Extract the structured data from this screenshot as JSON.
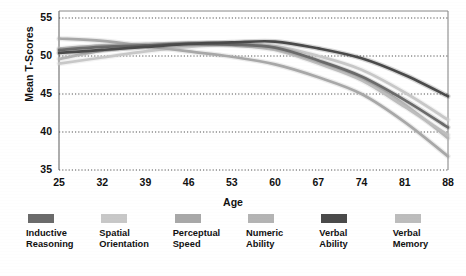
{
  "chart_data": {
    "type": "line",
    "title": "",
    "xlabel": "Age",
    "ylabel": "Mean T-Scores",
    "x": [
      25,
      32,
      39,
      46,
      53,
      60,
      67,
      74,
      81,
      88
    ],
    "xticklabels": [
      "25",
      "32",
      "39",
      "46",
      "53",
      "60",
      "67",
      "74",
      "81",
      "88"
    ],
    "yticklabels": [
      "35",
      "40",
      "45",
      "50",
      "55"
    ],
    "yticks": [
      35,
      40,
      45,
      50,
      55
    ],
    "xlim": [
      25,
      88
    ],
    "ylim": [
      35,
      55.6
    ],
    "grid": "horizontal-dotted",
    "legend_position": "below",
    "series": [
      {
        "name": "Inductive Reasoning",
        "color": "#6b6b6b",
        "values": [
          50.8,
          51.2,
          51.4,
          51.6,
          51.5,
          51.1,
          49.4,
          47.3,
          44.2,
          40.6
        ]
      },
      {
        "name": "Spatial Orientation",
        "color": "#c8c8c8",
        "values": [
          49.0,
          49.8,
          50.6,
          51.2,
          51.5,
          51.3,
          50.0,
          48.2,
          45.2,
          41.6
        ]
      },
      {
        "name": "Perceptual Speed",
        "color": "#a8a8a8",
        "values": [
          52.3,
          52.0,
          51.3,
          50.6,
          49.9,
          48.9,
          47.2,
          45.0,
          41.3,
          36.8
        ]
      },
      {
        "name": "Numeric Ability",
        "color": "#b4b4b4",
        "values": [
          49.6,
          50.7,
          51.3,
          51.7,
          51.7,
          51.0,
          49.3,
          47.0,
          43.6,
          39.2
        ]
      },
      {
        "name": "Verbal Ability",
        "color": "#4a4a4a",
        "values": [
          50.4,
          50.8,
          51.2,
          51.6,
          51.8,
          51.9,
          51.0,
          49.7,
          47.5,
          44.7
        ]
      },
      {
        "name": "Verbal Memory",
        "color": "#bdbdbd",
        "values": [
          51.0,
          51.4,
          51.6,
          51.7,
          51.4,
          50.8,
          49.0,
          46.8,
          43.3,
          39.6
        ]
      }
    ]
  },
  "axes": {
    "y_title": "Mean T-Scores",
    "x_title": "Age"
  },
  "legend": {
    "items": [
      {
        "label": "Inductive\nReasoning",
        "color": "#6b6b6b"
      },
      {
        "label": "Spatial\nOrientation",
        "color": "#c8c8c8"
      },
      {
        "label": "Perceptual\nSpeed",
        "color": "#a8a8a8"
      },
      {
        "label": "Numeric\nAbility",
        "color": "#b4b4b4"
      },
      {
        "label": "Verbal\nAbility",
        "color": "#4a4a4a"
      },
      {
        "label": "Verbal\nMemory",
        "color": "#bdbdbd"
      }
    ]
  }
}
